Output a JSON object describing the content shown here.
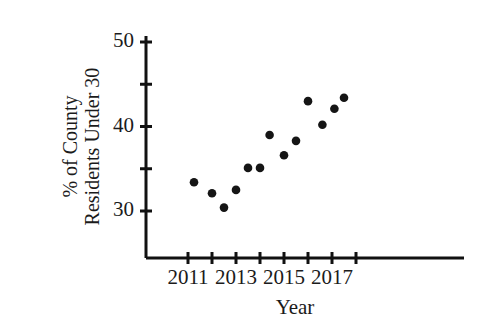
{
  "chart_data": {
    "type": "scatter",
    "title": "",
    "xlabel": "Year",
    "ylabel": "% of County Residents Under 30",
    "ylabel_line1": "% of County",
    "ylabel_line2": "Residents Under 30",
    "xlim": [
      2010.6,
      2017.9
    ],
    "ylim": [
      26.5,
      51.5
    ],
    "grid": false,
    "legend": null,
    "xtick_labels": [
      "2011",
      "2013",
      "2015",
      "2017"
    ],
    "xtick_values": [
      2011,
      2013,
      2015,
      2017
    ],
    "xminor_tick_values": [
      2012,
      2014,
      2016,
      2018
    ],
    "ytick_labels": [
      "30",
      "40",
      "50"
    ],
    "ytick_values": [
      30,
      40,
      50
    ],
    "yminor_tick_values": [
      35,
      45
    ],
    "marker": "filled-circle",
    "marker_color": "#151515",
    "x": [
      2011.25,
      2012.0,
      2012.5,
      2013.0,
      2013.5,
      2014.0,
      2014.4,
      2015.0,
      2015.5,
      2016.0,
      2016.6,
      2017.1,
      2017.5
    ],
    "values": [
      33.4,
      32.1,
      30.4,
      32.5,
      35.1,
      35.1,
      39.0,
      36.6,
      38.3,
      43.0,
      40.2,
      42.1,
      43.4
    ],
    "points": [
      {
        "x": 2011.25,
        "y": 33.4
      },
      {
        "x": 2012.0,
        "y": 32.1
      },
      {
        "x": 2012.5,
        "y": 30.4
      },
      {
        "x": 2013.0,
        "y": 32.5
      },
      {
        "x": 2013.5,
        "y": 35.1
      },
      {
        "x": 2014.0,
        "y": 35.1
      },
      {
        "x": 2014.4,
        "y": 39.0
      },
      {
        "x": 2015.0,
        "y": 36.6
      },
      {
        "x": 2015.5,
        "y": 38.3
      },
      {
        "x": 2016.0,
        "y": 43.0
      },
      {
        "x": 2016.6,
        "y": 40.2
      },
      {
        "x": 2017.1,
        "y": 42.1
      },
      {
        "x": 2017.5,
        "y": 43.4
      }
    ],
    "axis_color": "#111111",
    "background_color": "#ffffff"
  }
}
